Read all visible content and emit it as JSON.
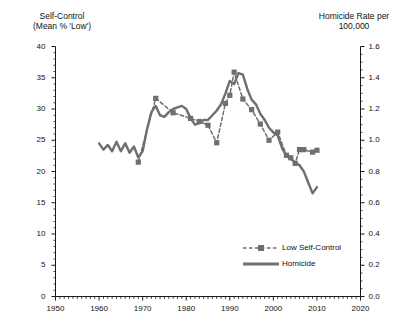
{
  "chart_data": {
    "type": "line",
    "title": "",
    "xlabel": "",
    "ylabel": "Self-Control (Mean % 'Low')",
    "y2label": "Homicide Rate per 100,000",
    "xlim": [
      1950,
      2020
    ],
    "ylim": [
      0,
      40
    ],
    "y2lim": [
      0.0,
      1.6
    ],
    "grid": false,
    "legend_position": "inside-bottom-right",
    "x_ticks": [
      "1950",
      "1960",
      "1970",
      "1980",
      "1990",
      "2000",
      "2010",
      "2020"
    ],
    "x_tick_values": [
      1950,
      1960,
      1970,
      1980,
      1990,
      2000,
      2010,
      2020
    ],
    "x_minor_tick_interval": 1,
    "y_ticks": [
      "0",
      "5",
      "10",
      "15",
      "20",
      "25",
      "30",
      "35",
      "40"
    ],
    "y_tick_values": [
      0,
      5,
      10,
      15,
      20,
      25,
      30,
      35,
      40
    ],
    "y_minor_tick_interval": 1,
    "y2_ticks": [
      "0.0",
      "0.2",
      "0.4",
      "0.6",
      "0.8",
      "1.0",
      "1.2",
      "1.4",
      "1.6"
    ],
    "y2_tick_values": [
      0.0,
      0.2,
      0.4,
      0.6,
      0.8,
      1.0,
      1.2,
      1.4,
      1.6
    ],
    "y2_minor_tick_interval": 0.05,
    "series": [
      {
        "name": "Low Self-Control",
        "axis": "left",
        "style": "dashed",
        "marker": "square",
        "color": "#6f6f6f",
        "x": [
          1969,
          1973,
          1977,
          1981,
          1983,
          1985,
          1987,
          1989,
          1990,
          1991,
          1993,
          1995,
          1997,
          1999,
          2001,
          2003,
          2004,
          2005,
          2006,
          2007,
          2009,
          2010
        ],
        "values": [
          21.5,
          31.7,
          29.4,
          28.5,
          28.0,
          27.4,
          24.6,
          30.9,
          32.2,
          35.9,
          31.6,
          29.9,
          27.6,
          25.0,
          26.3,
          22.6,
          22.2,
          21.3,
          23.5,
          23.5,
          23.1,
          23.4
        ]
      },
      {
        "name": "Homicide",
        "axis": "right",
        "style": "solid",
        "marker": "none",
        "color": "#6f6f6f",
        "x": [
          1960,
          1961,
          1962,
          1963,
          1964,
          1965,
          1966,
          1967,
          1968,
          1969,
          1970,
          1971,
          1972,
          1973,
          1974,
          1975,
          1976,
          1977,
          1978,
          1979,
          1980,
          1981,
          1982,
          1983,
          1984,
          1985,
          1986,
          1987,
          1988,
          1989,
          1990,
          1991,
          1992,
          1993,
          1994,
          1995,
          1996,
          1997,
          1998,
          1999,
          2000,
          2001,
          2002,
          2003,
          2004,
          2005,
          2006,
          2007,
          2008,
          2009,
          2010
        ],
        "values": [
          0.98,
          0.94,
          0.97,
          0.93,
          0.99,
          0.93,
          0.98,
          0.92,
          0.96,
          0.89,
          0.93,
          1.07,
          1.18,
          1.22,
          1.16,
          1.15,
          1.18,
          1.2,
          1.21,
          1.22,
          1.2,
          1.14,
          1.1,
          1.11,
          1.13,
          1.13,
          1.16,
          1.19,
          1.23,
          1.3,
          1.38,
          1.36,
          1.43,
          1.42,
          1.33,
          1.26,
          1.23,
          1.17,
          1.13,
          1.08,
          1.05,
          1.03,
          0.95,
          0.9,
          0.88,
          0.86,
          0.84,
          0.8,
          0.73,
          0.66,
          0.7
        ]
      }
    ]
  },
  "legend": {
    "items": [
      {
        "label": "Low Self-Control",
        "style": "dashed-square",
        "color": "#6f6f6f"
      },
      {
        "label": "Homicide",
        "style": "solid",
        "color": "#6f6f6f"
      }
    ]
  },
  "axis_titles": {
    "left_line1": "Self-Control",
    "left_line2": "(Mean % 'Low')",
    "right_line1": "Homicide Rate per",
    "right_line2": "100,000"
  },
  "colors": {
    "series": "#6f6f6f",
    "axis": "#1a1a1a",
    "background": "#ffffff"
  }
}
